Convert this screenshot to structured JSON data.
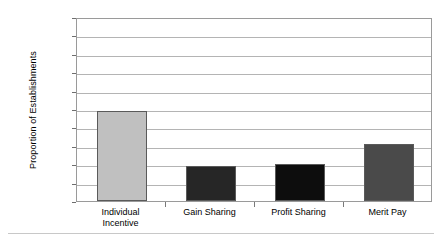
{
  "chart_data": {
    "type": "bar",
    "title": "",
    "xlabel": "",
    "ylabel": "Proportion of Establishments",
    "categories": [
      "Individual Incentive",
      "Gain Sharing",
      "Profit Sharing",
      "Merit Pay"
    ],
    "category_lines": [
      [
        "Individual",
        "Incentive"
      ],
      [
        "Gain Sharing"
      ],
      [
        "Profit Sharing"
      ],
      [
        "Merit Pay"
      ]
    ],
    "values": [
      49,
      19,
      20,
      31
    ],
    "bar_colors": [
      "#c0c0c0",
      "#262626",
      "#0d0d0d",
      "#4a4a4a"
    ],
    "ylim": [
      0,
      100
    ],
    "ytick_labels": [
      "100",
      "90",
      "80",
      "70",
      "60",
      "50",
      "40",
      "30",
      "20",
      "10",
      "0"
    ],
    "ytick_values": [
      100,
      90,
      80,
      70,
      60,
      50,
      40,
      30,
      20,
      10,
      0
    ],
    "grid": true,
    "legend": "none",
    "axis_color": "#9a9a9a",
    "gridline_color": "#b4b4b4",
    "background": "#ffffff"
  }
}
